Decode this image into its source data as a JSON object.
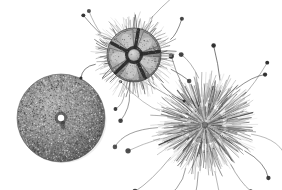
{
  "plate": {
    "width": 282,
    "height": 190,
    "background_color": "#ffffff",
    "medium": "grayscale engraving / halftone illustration",
    "subject": "three sea urchin specimens",
    "caption": "",
    "specimen_count": 3
  },
  "palette": {
    "background": "#ffffff",
    "ink_dark": "#2a2a2a",
    "ink_mid": "#6e6e6e",
    "ink_light": "#b4b4b4",
    "spine_gray": "#8a8a8a",
    "shadow": "#444444",
    "highlight": "#e8e8e8",
    "knob_tip": "#262626"
  },
  "specimens": [
    {
      "id": "specimen-top",
      "name": "pentaradial-urchin-oral-view",
      "label": "Top specimen",
      "description": "Oral view showing five-part jaw apparatus with pale interambulacral lobes, dark radiating grooves and a central boss, ringed by a dense fringe of short spines and a few long knob-tipped tube feet.",
      "center_x": 134,
      "center_y": 55,
      "body_radius": 30,
      "spine_length": 16,
      "spine_count": 210,
      "disc_radius": 27,
      "lobe_count": 5,
      "lobe_color": "#b0b0b0",
      "groove_color": "#2a2a2a",
      "boss_radius": 6,
      "boss_color": "#c8c8c8",
      "tentacle_count": 9,
      "tentacle_length": 26,
      "texture_dots": 500,
      "rotation": -8
    },
    {
      "id": "specimen-left",
      "name": "bare-test-aboral-view",
      "label": "Left specimen",
      "description": "Denuded test (shell) seen from above; concentric and radial rows of tubercles give a finely stippled surface, with a bright white apical disc at the centre.",
      "center_x": 61,
      "center_y": 118,
      "body_radius": 44,
      "spine_length": 0,
      "spine_count": 0,
      "plate_rows": 22,
      "tubercle_dots": 2600,
      "apical_radius": 3.2,
      "apical_color": "#ffffff",
      "apical_ring_color": "#3a3a3a",
      "rotation": 12
    },
    {
      "id": "specimen-right",
      "name": "spined-urchin-aboral-view",
      "label": "Right specimen",
      "description": "Living urchin densely clothed in tapering spines radiating from the centre, with long slender curved tube feet ending in dark spherical tips trailing below and to the sides.",
      "center_x": 205,
      "center_y": 125,
      "body_radius": 30,
      "spine_length": 28,
      "spine_count": 430,
      "spine_color": "#7d7d7d",
      "tentacle_count": 16,
      "tentacle_length": 40,
      "knob_radius": 2.2,
      "rotation": 0
    }
  ]
}
